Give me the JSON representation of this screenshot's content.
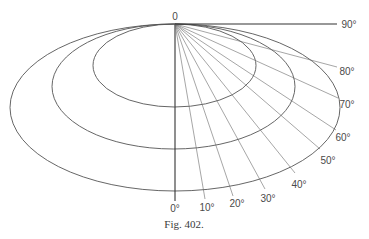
{
  "figure": {
    "caption": "Fig. 402.",
    "origin_label": "0",
    "line_color": "#555555",
    "ray_color": "#6a6a6a"
  },
  "ellipses": [
    {
      "name": "inner",
      "cx": 174.5,
      "cy": 65.5,
      "rx": 81.5,
      "ry": 41.5
    },
    {
      "name": "middle",
      "cx": 173.5,
      "cy": 86.5,
      "rx": 121.5,
      "ry": 62.5
    },
    {
      "name": "outer",
      "cx": 175,
      "cy": 107.5,
      "rx": 165,
      "ry": 83.5
    }
  ],
  "rays": [
    {
      "label": "0°",
      "x2": 175,
      "y2": 201,
      "lx": 175,
      "ly": 212
    },
    {
      "label": "10°",
      "x2": 205,
      "y2": 199,
      "lx": 207,
      "ly": 211
    },
    {
      "label": "20°",
      "x2": 233,
      "y2": 196,
      "lx": 237,
      "ly": 207
    },
    {
      "label": "30°",
      "x2": 265,
      "y2": 189,
      "lx": 268,
      "ly": 202
    },
    {
      "label": "40°",
      "x2": 295,
      "y2": 173,
      "lx": 299,
      "ly": 188
    },
    {
      "label": "50°",
      "x2": 320,
      "y2": 149,
      "lx": 328,
      "ly": 164
    },
    {
      "label": "60°",
      "x2": 336,
      "y2": 130,
      "lx": 343,
      "ly": 141
    },
    {
      "label": "70°",
      "x2": 338,
      "y2": 98,
      "lx": 347,
      "ly": 108
    },
    {
      "label": "80°",
      "x2": 337,
      "y2": 67,
      "lx": 347,
      "ly": 75
    },
    {
      "label": "90°",
      "x2": 337,
      "y2": 24,
      "lx": 349,
      "ly": 28
    }
  ]
}
